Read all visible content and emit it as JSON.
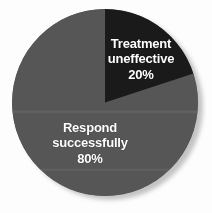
{
  "chart_data": {
    "type": "pie",
    "title": "",
    "subtitle": "",
    "xlabel": "",
    "ylabel": "",
    "legend_position": "none",
    "grid": false,
    "start_angle_deg": 0,
    "direction": "clockwise",
    "categories": [
      "Treatment uneffective",
      "Respond successfully"
    ],
    "values": [
      20,
      80
    ],
    "unit": "%",
    "colors": [
      "#1a1a1a",
      "#565656"
    ],
    "slices": [
      {
        "name": "Treatment uneffective",
        "value": 20,
        "value_label": "20%",
        "color": "#1a1a1a",
        "label_lines": [
          "Treatment",
          "uneffective",
          "20%"
        ]
      },
      {
        "name": "Respond successfully",
        "value": 80,
        "value_label": "80%",
        "color": "#565656",
        "label_lines": [
          "Respond",
          "successfully",
          "80%"
        ]
      }
    ]
  },
  "figure": {
    "background_color": "#fdfdfd",
    "shadow_color": "#b9b9b9"
  },
  "labels": {
    "uneffective": {
      "line1": "Treatment",
      "line2": "uneffective",
      "line3": "20%"
    },
    "respond": {
      "line1": "Respond",
      "line2": "successfully",
      "line3": "80%"
    }
  }
}
